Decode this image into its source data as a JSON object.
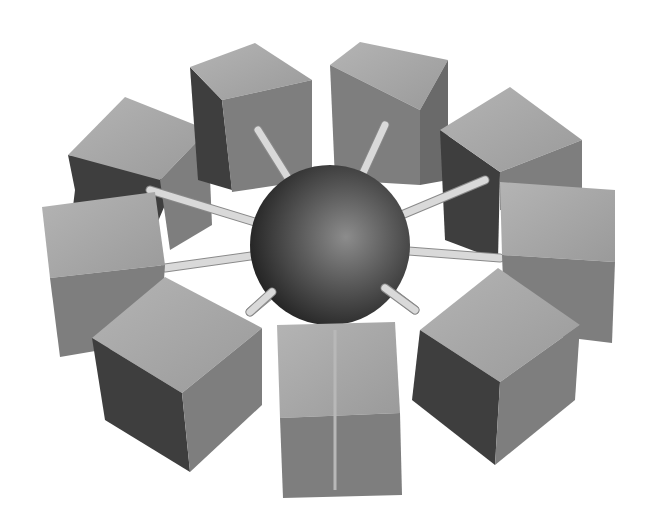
{
  "image": {
    "description": "Grayscale 3D illustration of a central sphere hub connected by rods to a ring of cubes",
    "width": 655,
    "height": 530,
    "background": "#ffffff"
  },
  "hub": {
    "shape": "sphere",
    "center": [
      330,
      245
    ],
    "radius": 80,
    "color": "#4a4a4a",
    "highlight": "#8c8c8c"
  },
  "nodes": [
    {
      "name": "cube-upper-left",
      "position": "upper-left"
    },
    {
      "name": "cube-top-left",
      "position": "top-left"
    },
    {
      "name": "cube-top-right",
      "position": "top-right"
    },
    {
      "name": "cube-upper-right",
      "position": "upper-right"
    },
    {
      "name": "cube-right",
      "position": "right"
    },
    {
      "name": "cube-lower-right",
      "position": "lower-right"
    },
    {
      "name": "cube-bottom",
      "position": "bottom"
    },
    {
      "name": "cube-lower-left",
      "position": "lower-left"
    },
    {
      "name": "cube-left",
      "position": "left"
    }
  ],
  "colors": {
    "cube_top": "#a9a9a9",
    "cube_front": "#7e7e7e",
    "cube_side_dark": "#3e3e3e",
    "rod": "#d9d9d9"
  }
}
